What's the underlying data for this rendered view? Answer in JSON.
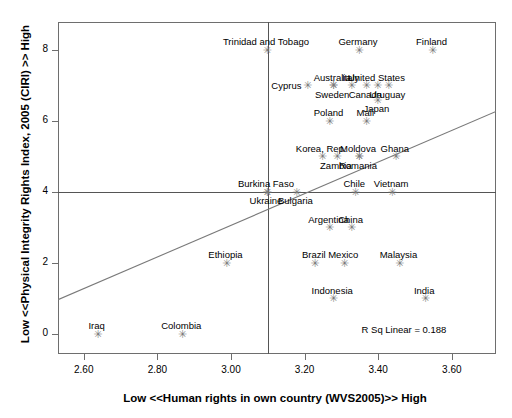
{
  "chart_data": {
    "type": "scatter",
    "title": "",
    "xlabel": "Low <<Human rights in own country (WVS2005)>> High",
    "ylabel": "Low <<Physical Integrity Rights Index, 2005 (CIRI) >> High",
    "xlim": [
      2.53,
      3.72
    ],
    "ylim": [
      -0.55,
      8.8
    ],
    "xticks": [
      "2.60",
      "2.80",
      "3.00",
      "3.20",
      "3.40",
      "3.60"
    ],
    "xtick_values": [
      2.6,
      2.8,
      3.0,
      3.2,
      3.4,
      3.6
    ],
    "yticks": [
      "0",
      "2",
      "4",
      "6",
      "8"
    ],
    "ytick_values": [
      0,
      2,
      4,
      6,
      8
    ],
    "grid": false,
    "legend": null,
    "annotation": "R Sq Linear = 0.188",
    "annotation_x": 3.47,
    "annotation_y": 0.12,
    "reference_lines": {
      "vertical_x": 3.1,
      "horizontal_y": 4
    },
    "fit_line": {
      "x0": 2.53,
      "y0": 0.98,
      "x1": 3.72,
      "y1": 6.28
    },
    "points": [
      {
        "label": "Trinidad and Tobago",
        "x": 3.095,
        "y": 8.0,
        "label_pos": "above"
      },
      {
        "label": "Germany",
        "x": 3.345,
        "y": 8.0,
        "label_pos": "above"
      },
      {
        "label": "Finland",
        "x": 3.545,
        "y": 8.0,
        "label_pos": "above"
      },
      {
        "label": "Cyprus",
        "x": 3.205,
        "y": 7.0,
        "label_pos": "left"
      },
      {
        "label": "Australia",
        "x": 3.275,
        "y": 7.0,
        "label_pos": "above"
      },
      {
        "label": "Italy",
        "x": 3.325,
        "y": 7.0,
        "label_pos": "above"
      },
      {
        "label": "United States",
        "x": 3.395,
        "y": 7.0,
        "label_pos": "above"
      },
      {
        "label": "Sweden",
        "x": 3.275,
        "y": 7.0,
        "label_pos": "below"
      },
      {
        "label": "Canada",
        "x": 3.365,
        "y": 7.0,
        "label_pos": "below"
      },
      {
        "label": "Uruguay",
        "x": 3.425,
        "y": 7.0,
        "label_pos": "below"
      },
      {
        "label": "Japan",
        "x": 3.395,
        "y": 6.6,
        "label_pos": "below2"
      },
      {
        "label": "Poland",
        "x": 3.265,
        "y": 6.0,
        "label_pos": "above"
      },
      {
        "label": "Mali",
        "x": 3.365,
        "y": 6.0,
        "label_pos": "above"
      },
      {
        "label": "Korea, Rep.",
        "x": 3.245,
        "y": 5.0,
        "label_pos": "above"
      },
      {
        "label": "Moldova",
        "x": 3.345,
        "y": 5.0,
        "label_pos": "above"
      },
      {
        "label": "Ghana",
        "x": 3.445,
        "y": 5.0,
        "label_pos": "above"
      },
      {
        "label": "Zambia",
        "x": 3.285,
        "y": 5.0,
        "label_pos": "below"
      },
      {
        "label": "Romania",
        "x": 3.345,
        "y": 5.0,
        "label_pos": "below"
      },
      {
        "label": "Burkina Faso",
        "x": 3.095,
        "y": 4.0,
        "label_pos": "above"
      },
      {
        "label": "Chile",
        "x": 3.335,
        "y": 4.0,
        "label_pos": "above"
      },
      {
        "label": "Vietnam",
        "x": 3.435,
        "y": 4.0,
        "label_pos": "above"
      },
      {
        "label": "Ukraine",
        "x": 3.095,
        "y": 4.0,
        "label_pos": "below"
      },
      {
        "label": "Bulgaria",
        "x": 3.175,
        "y": 4.0,
        "label_pos": "below"
      },
      {
        "label": "Argentina",
        "x": 3.265,
        "y": 3.0,
        "label_pos": "above"
      },
      {
        "label": "China",
        "x": 3.325,
        "y": 3.0,
        "label_pos": "above"
      },
      {
        "label": "Ethiopia",
        "x": 2.985,
        "y": 2.0,
        "label_pos": "above"
      },
      {
        "label": "Brazil",
        "x": 3.225,
        "y": 2.0,
        "label_pos": "above"
      },
      {
        "label": "Mexico",
        "x": 3.305,
        "y": 2.0,
        "label_pos": "above"
      },
      {
        "label": "Malaysia",
        "x": 3.455,
        "y": 2.0,
        "label_pos": "above"
      },
      {
        "label": "Indonesia",
        "x": 3.275,
        "y": 1.0,
        "label_pos": "above"
      },
      {
        "label": "India",
        "x": 3.525,
        "y": 1.0,
        "label_pos": "above"
      },
      {
        "label": "Iraq",
        "x": 2.635,
        "y": 0.0,
        "label_pos": "above"
      },
      {
        "label": "Colombia",
        "x": 2.865,
        "y": 0.0,
        "label_pos": "above"
      }
    ]
  }
}
